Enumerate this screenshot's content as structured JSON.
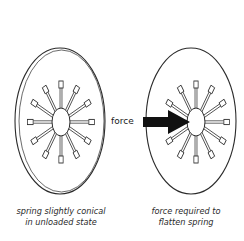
{
  "figure": {
    "left_panel": {
      "caption_line1": "spring slightly conical",
      "caption_line2": "in unloaded state"
    },
    "right_panel": {
      "arrow_label": "force",
      "caption_line1": "force required to",
      "caption_line2": "flatten spring"
    },
    "colors": {
      "line": "#2b2b2b",
      "arrow": "#111111",
      "background": "#ffffff"
    }
  }
}
